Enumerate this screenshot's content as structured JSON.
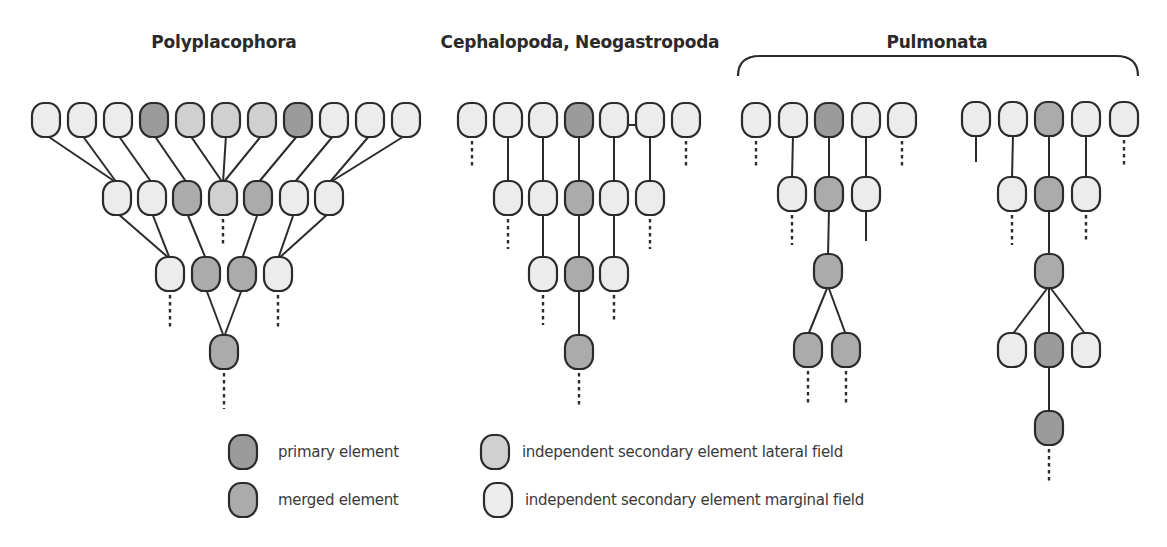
{
  "colors": {
    "primary": "#9b9b9b",
    "merged": "#ababab",
    "lateral": "#d0d0d0",
    "marginal": "#ececec",
    "stroke": "#2b2b2b"
  },
  "node_size": {
    "w": 28,
    "h": 34
  },
  "titles": [
    {
      "id": "polyplacophora",
      "label": "Polyplacophora",
      "x": 224,
      "y": 32
    },
    {
      "id": "cephalopoda-neogastropoda",
      "label": "Cephalopoda, Neogastropoda",
      "x": 580,
      "y": 32
    },
    {
      "id": "pulmonata",
      "label": "Pulmonata",
      "x": 937,
      "y": 32
    }
  ],
  "brace": {
    "x1": 738,
    "x2": 1138,
    "y_top": 56,
    "y_bottom": 76
  },
  "legend": [
    {
      "type": "primary",
      "label": "primary element",
      "x": 243,
      "y": 452,
      "label_x": 278,
      "label_y": 443
    },
    {
      "type": "merged",
      "label": "merged element",
      "x": 243,
      "y": 500,
      "label_x": 278,
      "label_y": 491
    },
    {
      "type": "lateral",
      "label": "independent secondary element lateral field",
      "x": 495,
      "y": 452,
      "label_x": 522,
      "label_y": 443
    },
    {
      "type": "marginal",
      "label": "independent secondary element marginal field",
      "x": 498,
      "y": 500,
      "label_x": 525,
      "label_y": 491
    }
  ],
  "diagrams": [
    {
      "name": "polyplacophora",
      "nodes": [
        {
          "id": "p0",
          "x": 46,
          "y": 120,
          "type": "marginal"
        },
        {
          "id": "p1",
          "x": 82,
          "y": 120,
          "type": "marginal"
        },
        {
          "id": "p2",
          "x": 118,
          "y": 120,
          "type": "marginal"
        },
        {
          "id": "p3",
          "x": 154,
          "y": 120,
          "type": "primary"
        },
        {
          "id": "p4",
          "x": 190,
          "y": 120,
          "type": "lateral"
        },
        {
          "id": "p5",
          "x": 226,
          "y": 120,
          "type": "lateral"
        },
        {
          "id": "p6",
          "x": 262,
          "y": 120,
          "type": "lateral"
        },
        {
          "id": "p7",
          "x": 298,
          "y": 120,
          "type": "primary"
        },
        {
          "id": "p8",
          "x": 334,
          "y": 120,
          "type": "marginal"
        },
        {
          "id": "p9",
          "x": 370,
          "y": 120,
          "type": "marginal"
        },
        {
          "id": "p10",
          "x": 406,
          "y": 120,
          "type": "marginal"
        },
        {
          "id": "q0",
          "x": 117,
          "y": 198,
          "type": "marginal"
        },
        {
          "id": "q1",
          "x": 152,
          "y": 198,
          "type": "marginal"
        },
        {
          "id": "q2",
          "x": 187,
          "y": 198,
          "type": "merged"
        },
        {
          "id": "q3",
          "x": 223,
          "y": 198,
          "type": "lateral"
        },
        {
          "id": "q4",
          "x": 258,
          "y": 198,
          "type": "merged"
        },
        {
          "id": "q5",
          "x": 294,
          "y": 198,
          "type": "marginal"
        },
        {
          "id": "q6",
          "x": 329,
          "y": 198,
          "type": "marginal"
        },
        {
          "id": "r0",
          "x": 170,
          "y": 274,
          "type": "marginal"
        },
        {
          "id": "r1",
          "x": 206,
          "y": 274,
          "type": "merged"
        },
        {
          "id": "r2",
          "x": 242,
          "y": 274,
          "type": "merged"
        },
        {
          "id": "r3",
          "x": 278,
          "y": 274,
          "type": "marginal"
        },
        {
          "id": "s0",
          "x": 224,
          "y": 352,
          "type": "merged"
        }
      ],
      "edges": [
        [
          "p0",
          "q0"
        ],
        [
          "p1",
          "q0"
        ],
        [
          "p2",
          "q1"
        ],
        [
          "p3",
          "q2"
        ],
        [
          "p4",
          "q3"
        ],
        [
          "p5",
          "q3"
        ],
        [
          "p6",
          "q3"
        ],
        [
          "p7",
          "q4"
        ],
        [
          "p8",
          "q5"
        ],
        [
          "p9",
          "q6"
        ],
        [
          "p10",
          "q6"
        ],
        [
          "q0",
          "r0"
        ],
        [
          "q1",
          "r0"
        ],
        [
          "q2",
          "r1"
        ],
        [
          "q4",
          "r2"
        ],
        [
          "q5",
          "r3"
        ],
        [
          "q6",
          "r3"
        ],
        [
          "r1",
          "s0"
        ],
        [
          "r2",
          "s0"
        ]
      ],
      "dashes": [
        {
          "from": "q3",
          "length": 28
        },
        {
          "from": "r0",
          "length": 34
        },
        {
          "from": "r3",
          "length": 34
        },
        {
          "from": "s0",
          "length": 36
        }
      ],
      "bars": []
    },
    {
      "name": "cephalopoda-neogastropoda",
      "nodes": [
        {
          "id": "a0",
          "x": 472,
          "y": 120,
          "type": "marginal"
        },
        {
          "id": "a1",
          "x": 508,
          "y": 120,
          "type": "marginal"
        },
        {
          "id": "a2",
          "x": 543,
          "y": 120,
          "type": "marginal"
        },
        {
          "id": "a3",
          "x": 579,
          "y": 120,
          "type": "primary"
        },
        {
          "id": "a4",
          "x": 614,
          "y": 120,
          "type": "marginal"
        },
        {
          "id": "a5",
          "x": 650,
          "y": 120,
          "type": "marginal"
        },
        {
          "id": "a6",
          "x": 686,
          "y": 120,
          "type": "marginal"
        },
        {
          "id": "b0",
          "x": 508,
          "y": 198,
          "type": "marginal"
        },
        {
          "id": "b1",
          "x": 543,
          "y": 198,
          "type": "marginal"
        },
        {
          "id": "b2",
          "x": 579,
          "y": 198,
          "type": "merged"
        },
        {
          "id": "b3",
          "x": 614,
          "y": 198,
          "type": "marginal"
        },
        {
          "id": "b4",
          "x": 650,
          "y": 198,
          "type": "marginal"
        },
        {
          "id": "c0",
          "x": 543,
          "y": 274,
          "type": "marginal"
        },
        {
          "id": "c1",
          "x": 579,
          "y": 274,
          "type": "merged"
        },
        {
          "id": "c2",
          "x": 614,
          "y": 274,
          "type": "marginal"
        },
        {
          "id": "d0",
          "x": 579,
          "y": 352,
          "type": "merged"
        }
      ],
      "edges": [
        [
          "a1",
          "b0"
        ],
        [
          "a2",
          "b1"
        ],
        [
          "a3",
          "b2"
        ],
        [
          "a4",
          "b3"
        ],
        [
          "a5",
          "b4"
        ],
        [
          "b1",
          "c0"
        ],
        [
          "b2",
          "c1"
        ],
        [
          "b3",
          "c2"
        ],
        [
          "c1",
          "d0"
        ]
      ],
      "dashes": [
        {
          "from": "a0",
          "length": 26
        },
        {
          "from": "a6",
          "length": 26
        },
        {
          "from": "b0",
          "length": 30
        },
        {
          "from": "b4",
          "length": 30
        },
        {
          "from": "c0",
          "length": 30
        },
        {
          "from": "c2",
          "length": 28
        },
        {
          "from": "d0",
          "length": 32
        }
      ],
      "bars": [
        {
          "from": "a4",
          "to": "a5",
          "dy": 5
        }
      ]
    },
    {
      "name": "pulmonata-left",
      "nodes": [
        {
          "id": "e0",
          "x": 756,
          "y": 120,
          "type": "marginal"
        },
        {
          "id": "e1",
          "x": 793,
          "y": 120,
          "type": "marginal"
        },
        {
          "id": "e2",
          "x": 829,
          "y": 120,
          "type": "primary"
        },
        {
          "id": "e3",
          "x": 866,
          "y": 120,
          "type": "marginal"
        },
        {
          "id": "e4",
          "x": 902,
          "y": 120,
          "type": "marginal"
        },
        {
          "id": "f0",
          "x": 792,
          "y": 194,
          "type": "marginal"
        },
        {
          "id": "f1",
          "x": 829,
          "y": 194,
          "type": "merged"
        },
        {
          "id": "f2",
          "x": 866,
          "y": 194,
          "type": "marginal"
        },
        {
          "id": "g0",
          "x": 828,
          "y": 271,
          "type": "merged"
        },
        {
          "id": "h0",
          "x": 808,
          "y": 350,
          "type": "merged"
        },
        {
          "id": "h1",
          "x": 846,
          "y": 350,
          "type": "merged"
        }
      ],
      "edges": [
        [
          "e1",
          "f0"
        ],
        [
          "e2",
          "f1"
        ],
        [
          "e3",
          "f2"
        ],
        [
          "f1",
          "g0"
        ],
        [
          "g0",
          "h0"
        ],
        [
          "g0",
          "h1"
        ]
      ],
      "dashes": [
        {
          "from": "e0",
          "length": 26
        },
        {
          "from": "e4",
          "length": 26
        },
        {
          "from": "f0",
          "length": 30
        },
        {
          "from": "h0",
          "length": 32
        },
        {
          "from": "h1",
          "length": 32
        }
      ],
      "solid_stubs": [
        {
          "from": "f2",
          "length": 30
        }
      ],
      "bars": []
    },
    {
      "name": "pulmonata-right",
      "nodes": [
        {
          "id": "i0",
          "x": 976,
          "y": 119,
          "type": "marginal"
        },
        {
          "id": "i1",
          "x": 1013,
          "y": 119,
          "type": "marginal"
        },
        {
          "id": "i2",
          "x": 1049,
          "y": 119,
          "type": "merged"
        },
        {
          "id": "i3",
          "x": 1086,
          "y": 119,
          "type": "marginal"
        },
        {
          "id": "i4",
          "x": 1124,
          "y": 119,
          "type": "marginal"
        },
        {
          "id": "j0",
          "x": 1012,
          "y": 194,
          "type": "marginal"
        },
        {
          "id": "j1",
          "x": 1049,
          "y": 194,
          "type": "merged"
        },
        {
          "id": "j2",
          "x": 1086,
          "y": 194,
          "type": "marginal"
        },
        {
          "id": "k0",
          "x": 1049,
          "y": 271,
          "type": "merged"
        },
        {
          "id": "l0",
          "x": 1012,
          "y": 350,
          "type": "marginal"
        },
        {
          "id": "l1",
          "x": 1049,
          "y": 350,
          "type": "primary"
        },
        {
          "id": "l2",
          "x": 1086,
          "y": 350,
          "type": "marginal"
        },
        {
          "id": "m0",
          "x": 1049,
          "y": 428,
          "type": "primary"
        }
      ],
      "edges": [
        [
          "i1",
          "j0"
        ],
        [
          "i2",
          "j1"
        ],
        [
          "i3",
          "j2"
        ],
        [
          "j1",
          "k0"
        ],
        [
          "k0",
          "l0"
        ],
        [
          "k0",
          "l1"
        ],
        [
          "k0",
          "l2"
        ],
        [
          "l1",
          "m0"
        ]
      ],
      "dashes": [
        {
          "from": "i4",
          "length": 26
        },
        {
          "from": "j0",
          "length": 30
        },
        {
          "from": "j2",
          "length": 28
        },
        {
          "from": "m0",
          "length": 34
        }
      ],
      "solid_stubs": [
        {
          "from": "i0",
          "length": 26
        }
      ],
      "bars": []
    }
  ]
}
